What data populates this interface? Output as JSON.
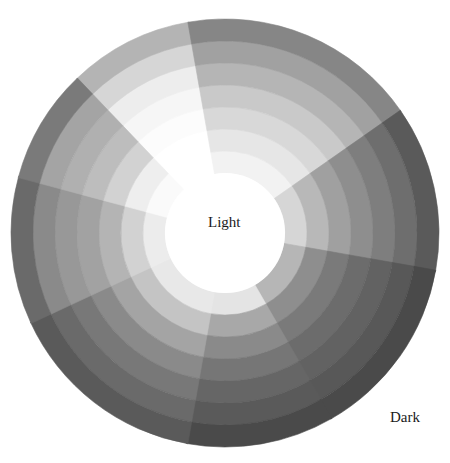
{
  "labels": {
    "center": "Light",
    "corner": "Dark"
  },
  "wheel": {
    "center": [
      225,
      233
    ],
    "outer_radius": 214,
    "inner_radius": 60,
    "ring_radii": [
      60,
      82,
      104,
      126,
      148,
      170,
      192,
      214
    ],
    "center_color": "#ffffff",
    "wedges": [
      {
        "name": "upper-left",
        "start": -134,
        "end": -100,
        "colors": [
          "#ffffff",
          "#ffffff",
          "#fcfcfc",
          "#f6f6f6",
          "#ededed",
          "#d6d6d6",
          "#b4b4b4"
        ]
      },
      {
        "name": "top",
        "start": -100,
        "end": -35,
        "colors": [
          "#f2f2f2",
          "#e6e6e6",
          "#d8d8d8",
          "#c9c9c9",
          "#b5b5b5",
          "#a1a1a1",
          "#868686"
        ]
      },
      {
        "name": "upper-right",
        "start": -35,
        "end": 10,
        "colors": [
          "#d6d6d6",
          "#b8b8b8",
          "#a0a0a0",
          "#8e8e8e",
          "#7e7e7e",
          "#6e6e6e",
          "#5a5a5a"
        ]
      },
      {
        "name": "right",
        "start": 10,
        "end": 60,
        "colors": [
          "#b6b6b6",
          "#8e8e8e",
          "#7a7a7a",
          "#6c6c6c",
          "#626262",
          "#585858",
          "#4a4a4a"
        ]
      },
      {
        "name": "lower-right",
        "start": 60,
        "end": 100,
        "colors": [
          "#e4e4e4",
          "#a8a8a8",
          "#8a8a8a",
          "#767676",
          "#666666",
          "#5a5a5a",
          "#4a4a4a"
        ]
      },
      {
        "name": "bottom",
        "start": 100,
        "end": 155,
        "colors": [
          "#e8e8e8",
          "#c4c4c4",
          "#a4a4a4",
          "#8a8a8a",
          "#787878",
          "#6a6a6a",
          "#5a5a5a"
        ]
      },
      {
        "name": "lower-left",
        "start": 155,
        "end": 195,
        "colors": [
          "#ececec",
          "#d2d2d2",
          "#b4b4b4",
          "#a2a2a2",
          "#989898",
          "#8a8a8a",
          "#6a6a6a"
        ]
      },
      {
        "name": "left",
        "start": 195,
        "end": 226,
        "colors": [
          "#fafafa",
          "#eeeeee",
          "#d2d2d2",
          "#bdbdbd",
          "#b0b0b0",
          "#a4a4a4",
          "#7a7a7a"
        ]
      }
    ]
  }
}
